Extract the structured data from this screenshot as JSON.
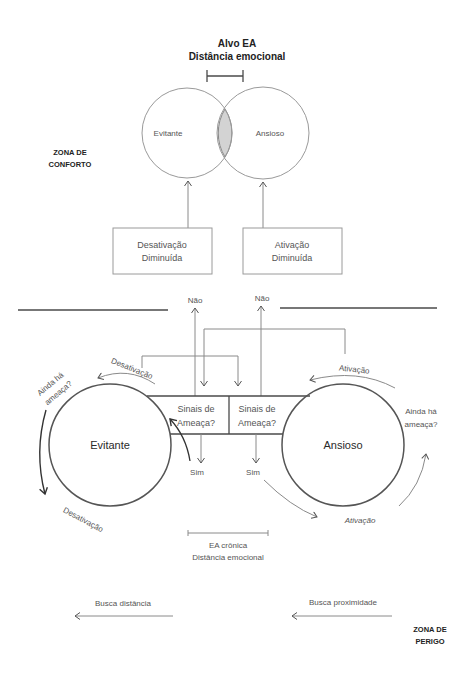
{
  "top": {
    "title_line1": "Alvo EA",
    "title_line2": "Distância emocional",
    "circle_left_label": "Evitante",
    "circle_right_label": "Ansioso",
    "box_left": {
      "line1": "Desativação",
      "line2": "Diminuída"
    },
    "box_right": {
      "line1": "Ativação",
      "line2": "Diminuída"
    },
    "zone": {
      "line1": "ZONA DE",
      "line2": "CONFORTO"
    }
  },
  "middle": {
    "no_left": "Não",
    "no_right": "Não",
    "signals_left": {
      "line1": "Sinais de",
      "line2": "Ameaça?"
    },
    "signals_right": {
      "line1": "Sinais de",
      "line2": "Ameaça?"
    },
    "yes_left": "Sim",
    "yes_right": "Sim",
    "circle_left_label": "Evitante",
    "circle_right_label": "Ansioso",
    "left_top_arc_label": "Desativação",
    "left_question": {
      "line1": "Ainda há",
      "line2": "ameaça?"
    },
    "left_bottom_label": "Desativação",
    "right_top_arc_label": "Ativação",
    "right_question": {
      "line1": "Ainda há",
      "line2": "ameaça?"
    },
    "right_bottom_label": "Ativação",
    "chronic": {
      "line1": "EA crônica",
      "line2": "Distância emocional"
    }
  },
  "bottom": {
    "seek_distance": "Busca distância",
    "seek_proximity": "Busca proximidade",
    "zone": {
      "line1": "ZONA DE",
      "line2": "PERIGO"
    }
  },
  "colors": {
    "background": "#ffffff",
    "overlap_fill": "#d3d3d3",
    "line_light": "#8a8a8a",
    "line_dark": "#4a4a4a",
    "text": "#555555",
    "text_bold": "#222222"
  }
}
